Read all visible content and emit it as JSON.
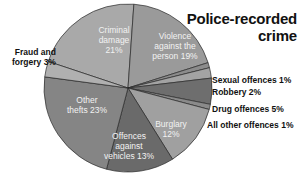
{
  "chart_data": {
    "type": "pie",
    "title": "Police-recorded crime",
    "unit": "%",
    "slices": [
      {
        "label": "Criminal damage",
        "value": 21,
        "color": "#a9a9a9",
        "label_position": "inside"
      },
      {
        "label": "Violence against the person",
        "value": 19,
        "color": "#9a9a9a",
        "label_position": "inside"
      },
      {
        "label": "Sexual offences",
        "value": 1,
        "color": "#8c8c8c",
        "label_position": "outside"
      },
      {
        "label": "Robbery",
        "value": 2,
        "color": "#a3a3a3",
        "label_position": "outside"
      },
      {
        "label": "Drug offences",
        "value": 5,
        "color": "#6e6e6e",
        "label_position": "outside"
      },
      {
        "label": "All other offences",
        "value": 1,
        "color": "#8a8a8a",
        "label_position": "outside"
      },
      {
        "label": "Burglary",
        "value": 12,
        "color": "#a0a0a0",
        "label_position": "inside"
      },
      {
        "label": "Offences against vehicles",
        "value": 13,
        "color": "#6a6a6a",
        "label_position": "inside"
      },
      {
        "label": "Other thefts",
        "value": 23,
        "color": "#858585",
        "label_position": "inside"
      },
      {
        "label": "Fraud and forgery",
        "value": 3,
        "color": "#b0b0b0",
        "label_position": "outside"
      }
    ],
    "legend": "none (direct labels)"
  },
  "labels": {
    "title_line1": "Police-recorded",
    "title_line2": "crime",
    "criminal_damage": [
      "Criminal",
      "damage",
      "21%"
    ],
    "violence": [
      "Violence",
      "against the",
      "person 19%"
    ],
    "other_thefts": [
      "Other",
      "thefts 23%"
    ],
    "vehicles": [
      "Offences",
      "against",
      "vehicles 13%"
    ],
    "burglary": [
      "Burglary",
      "12%"
    ],
    "fraud": [
      "Fraud and",
      "forgery 3%"
    ],
    "sexual": "Sexual offences 1%",
    "robbery": "Robbery 2%",
    "drug": "Drug offences 5%",
    "all_other": "All other offences 1%"
  }
}
